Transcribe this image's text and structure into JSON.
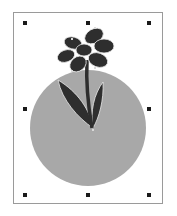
{
  "canvas": {
    "object": "flower-on-circle-graphic",
    "colors": {
      "circle_fill": "#a8a8a8",
      "flower_fill": "#2e2e2e",
      "outline": "#e8e8e8",
      "handle": "#1a1a1a",
      "page_border": "#9a9a9a"
    }
  },
  "selection": {
    "handles": [
      {
        "pos": "top-left",
        "x": 25,
        "y": 23
      },
      {
        "pos": "top-center",
        "x": 88,
        "y": 23
      },
      {
        "pos": "top-right",
        "x": 149,
        "y": 23
      },
      {
        "pos": "middle-left",
        "x": 25,
        "y": 109
      },
      {
        "pos": "middle-right",
        "x": 149,
        "y": 109
      },
      {
        "pos": "bottom-left",
        "x": 25,
        "y": 195
      },
      {
        "pos": "bottom-center",
        "x": 88,
        "y": 195
      },
      {
        "pos": "bottom-right",
        "x": 149,
        "y": 195
      }
    ]
  }
}
